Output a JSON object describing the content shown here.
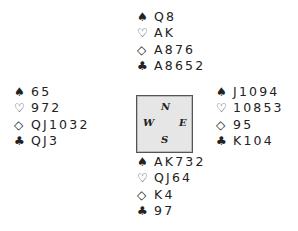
{
  "suits": {
    "spades": "♠",
    "hearts": "♡",
    "diamonds": "◇",
    "clubs": "♣"
  },
  "hands": {
    "north": {
      "spades": "Q8",
      "hearts": "AK",
      "diamonds": "A876",
      "clubs": "A8652"
    },
    "west": {
      "spades": "65",
      "hearts": "972",
      "diamonds": "QJ1032",
      "clubs": "QJ3"
    },
    "east": {
      "spades": "J1094",
      "hearts": "10853",
      "diamonds": "95",
      "clubs": "K104"
    },
    "south": {
      "spades": "AK732",
      "hearts": "QJ64",
      "diamonds": "K4",
      "clubs": "97"
    }
  },
  "compass": {
    "north": "N",
    "west": "W",
    "east": "E",
    "south": "S"
  }
}
